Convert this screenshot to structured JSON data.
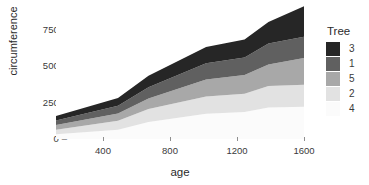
{
  "chart_data": {
    "type": "area",
    "stacked": true,
    "title": "",
    "subtitle": "",
    "xlabel": "age",
    "ylabel": "circumference",
    "xlim": [
      118,
      1582
    ],
    "ylim": [
      0,
      880
    ],
    "xticks": [
      400,
      800,
      1200,
      1600
    ],
    "yticks": [
      0,
      250,
      500,
      750
    ],
    "grid": false,
    "legend": {
      "title": "Tree",
      "position": "right",
      "entries": [
        {
          "name": "3",
          "color": "#262626"
        },
        {
          "name": "1",
          "color": "#606060"
        },
        {
          "name": "5",
          "color": "#a8a8a8"
        },
        {
          "name": "2",
          "color": "#e2e2e2"
        },
        {
          "name": "4",
          "color": "#fbfbfb"
        }
      ]
    },
    "x": [
      118,
      484,
      664,
      1004,
      1231,
      1372,
      1582
    ],
    "stack_order_bottom_to_top": [
      "4",
      "2",
      "5",
      "1",
      "3"
    ],
    "series": [
      {
        "name": "4",
        "color": "#fbfbfb",
        "values": [
          32,
          62,
          112,
          167,
          179,
          209,
          214
        ]
      },
      {
        "name": "2",
        "color": "#e2e2e2",
        "values": [
          30,
          58,
          87,
          115,
          120,
          142,
          145
        ]
      },
      {
        "name": "5",
        "color": "#a8a8a8",
        "values": [
          30,
          49,
          69,
          111,
          125,
          142,
          177
        ]
      },
      {
        "name": "1",
        "color": "#606060",
        "values": [
          30,
          51,
          75,
          108,
          115,
          139,
          140
        ]
      },
      {
        "name": "3",
        "color": "#262626",
        "values": [
          30,
          51,
          75,
          108,
          120,
          142,
          203
        ]
      }
    ],
    "stack_totals": [
      152,
      271,
      418,
      609,
      659,
      774,
      879
    ],
    "annotations": []
  },
  "axes": {
    "y_tick_labels": [
      "750",
      "500",
      "250",
      "0"
    ],
    "x_tick_labels": [
      "400",
      "800",
      "1200",
      "1600"
    ],
    "tick_dash": "–"
  }
}
